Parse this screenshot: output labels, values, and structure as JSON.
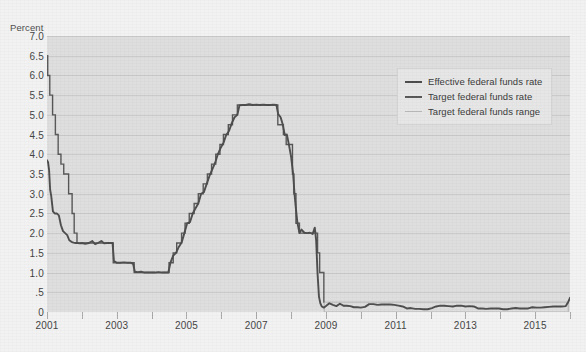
{
  "chart_data": {
    "type": "line",
    "title": "",
    "subtitle": "",
    "xlabel": "",
    "ylabel": "Percent",
    "ylim": [
      0,
      7.0
    ],
    "xlim": [
      2001,
      2016
    ],
    "grid": true,
    "legend_position": "upper-right",
    "y_ticks": [
      "0",
      ".5",
      "1.0",
      "1.5",
      "2.0",
      "2.5",
      "3.0",
      "3.5",
      "4.0",
      "4.5",
      "5.0",
      "5.5",
      "6.0",
      "6.5",
      "7.0"
    ],
    "y_tick_values": [
      0,
      0.5,
      1.0,
      1.5,
      2.0,
      2.5,
      3.0,
      3.5,
      4.0,
      4.5,
      5.0,
      5.5,
      6.0,
      6.5,
      7.0
    ],
    "x_ticks": [
      "2001",
      "2003",
      "2005",
      "2007",
      "2009",
      "2011",
      "2013",
      "2015"
    ],
    "x_tick_values": [
      2001,
      2003,
      2005,
      2007,
      2009,
      2011,
      2013,
      2015
    ],
    "x_minor_tick_values": [
      2001,
      2002,
      2003,
      2004,
      2005,
      2006,
      2007,
      2008,
      2009,
      2010,
      2011,
      2012,
      2013,
      2014,
      2015,
      2016
    ],
    "colors": {
      "effective": "#4a4a4a",
      "target": "#555555",
      "range": "#b9b9b9",
      "plot_background": "#dddddd",
      "page_background": "#f2f2f2",
      "gridline": "#c9c9c9",
      "text": "#3f3f3f"
    },
    "series": [
      {
        "name": "Effective federal funds rate",
        "color": "#4a4a4a",
        "points": [
          [
            2001.0,
            3.85
          ],
          [
            2001.03,
            3.8
          ],
          [
            2001.06,
            3.6
          ],
          [
            2001.09,
            3.1
          ],
          [
            2001.12,
            2.95
          ],
          [
            2001.17,
            2.55
          ],
          [
            2001.22,
            2.5
          ],
          [
            2001.28,
            2.5
          ],
          [
            2001.34,
            2.45
          ],
          [
            2001.4,
            2.2
          ],
          [
            2001.46,
            2.05
          ],
          [
            2001.52,
            2.0
          ],
          [
            2001.58,
            1.95
          ],
          [
            2001.64,
            1.82
          ],
          [
            2001.7,
            1.78
          ],
          [
            2001.76,
            1.76
          ],
          [
            2001.82,
            1.75
          ],
          [
            2001.88,
            1.75
          ],
          [
            2001.94,
            1.74
          ],
          [
            2002.0,
            1.75
          ],
          [
            2002.1,
            1.73
          ],
          [
            2002.2,
            1.75
          ],
          [
            2002.3,
            1.8
          ],
          [
            2002.38,
            1.72
          ],
          [
            2002.46,
            1.75
          ],
          [
            2002.56,
            1.8
          ],
          [
            2002.64,
            1.74
          ],
          [
            2002.72,
            1.75
          ],
          [
            2002.8,
            1.75
          ],
          [
            2002.88,
            1.75
          ],
          [
            2002.92,
            1.3
          ],
          [
            2003.0,
            1.25
          ],
          [
            2003.1,
            1.25
          ],
          [
            2003.2,
            1.26
          ],
          [
            2003.3,
            1.25
          ],
          [
            2003.4,
            1.25
          ],
          [
            2003.47,
            1.22
          ],
          [
            2003.52,
            1.02
          ],
          [
            2003.6,
            1.01
          ],
          [
            2003.7,
            1.02
          ],
          [
            2003.8,
            1.0
          ],
          [
            2003.9,
            1.0
          ],
          [
            2004.0,
            1.0
          ],
          [
            2004.1,
            1.0
          ],
          [
            2004.2,
            1.01
          ],
          [
            2004.3,
            1.0
          ],
          [
            2004.4,
            1.0
          ],
          [
            2004.48,
            1.0
          ],
          [
            2004.54,
            1.25
          ],
          [
            2004.62,
            1.43
          ],
          [
            2004.7,
            1.5
          ],
          [
            2004.78,
            1.65
          ],
          [
            2004.86,
            1.76
          ],
          [
            2004.94,
            2.0
          ],
          [
            2005.02,
            2.25
          ],
          [
            2005.1,
            2.28
          ],
          [
            2005.18,
            2.5
          ],
          [
            2005.26,
            2.63
          ],
          [
            2005.34,
            2.75
          ],
          [
            2005.42,
            3.0
          ],
          [
            2005.5,
            3.04
          ],
          [
            2005.58,
            3.25
          ],
          [
            2005.66,
            3.45
          ],
          [
            2005.74,
            3.62
          ],
          [
            2005.82,
            3.78
          ],
          [
            2005.9,
            4.0
          ],
          [
            2005.98,
            4.16
          ],
          [
            2006.06,
            4.29
          ],
          [
            2006.14,
            4.49
          ],
          [
            2006.22,
            4.59
          ],
          [
            2006.3,
            4.79
          ],
          [
            2006.38,
            4.94
          ],
          [
            2006.46,
            5.0
          ],
          [
            2006.52,
            5.24
          ],
          [
            2006.6,
            5.25
          ],
          [
            2006.7,
            5.25
          ],
          [
            2006.8,
            5.27
          ],
          [
            2006.9,
            5.25
          ],
          [
            2007.0,
            5.26
          ],
          [
            2007.1,
            5.25
          ],
          [
            2007.2,
            5.26
          ],
          [
            2007.3,
            5.25
          ],
          [
            2007.4,
            5.25
          ],
          [
            2007.5,
            5.26
          ],
          [
            2007.58,
            5.25
          ],
          [
            2007.63,
            5.02
          ],
          [
            2007.7,
            4.94
          ],
          [
            2007.76,
            4.76
          ],
          [
            2007.82,
            4.49
          ],
          [
            2007.88,
            4.5
          ],
          [
            2007.94,
            4.24
          ],
          [
            2008.0,
            3.94
          ],
          [
            2008.06,
            3.5
          ],
          [
            2008.1,
            2.98
          ],
          [
            2008.14,
            2.61
          ],
          [
            2008.18,
            2.28
          ],
          [
            2008.24,
            2.0
          ],
          [
            2008.3,
            2.09
          ],
          [
            2008.38,
            2.01
          ],
          [
            2008.46,
            2.0
          ],
          [
            2008.54,
            2.01
          ],
          [
            2008.62,
            1.98
          ],
          [
            2008.68,
            2.14
          ],
          [
            2008.72,
            1.81
          ],
          [
            2008.76,
            0.97
          ],
          [
            2008.8,
            0.39
          ],
          [
            2008.84,
            0.22
          ],
          [
            2008.88,
            0.14
          ],
          [
            2008.94,
            0.11
          ],
          [
            2009.0,
            0.15
          ],
          [
            2009.1,
            0.22
          ],
          [
            2009.2,
            0.18
          ],
          [
            2009.3,
            0.15
          ],
          [
            2009.4,
            0.21
          ],
          [
            2009.5,
            0.16
          ],
          [
            2009.6,
            0.16
          ],
          [
            2009.7,
            0.15
          ],
          [
            2009.8,
            0.12
          ],
          [
            2009.9,
            0.12
          ],
          [
            2010.0,
            0.11
          ],
          [
            2010.12,
            0.13
          ],
          [
            2010.24,
            0.2
          ],
          [
            2010.36,
            0.2
          ],
          [
            2010.48,
            0.18
          ],
          [
            2010.6,
            0.19
          ],
          [
            2010.72,
            0.19
          ],
          [
            2010.84,
            0.19
          ],
          [
            2010.96,
            0.18
          ],
          [
            2011.08,
            0.16
          ],
          [
            2011.2,
            0.14
          ],
          [
            2011.32,
            0.09
          ],
          [
            2011.44,
            0.1
          ],
          [
            2011.56,
            0.08
          ],
          [
            2011.68,
            0.08
          ],
          [
            2011.8,
            0.07
          ],
          [
            2011.92,
            0.07
          ],
          [
            2012.04,
            0.1
          ],
          [
            2012.16,
            0.14
          ],
          [
            2012.28,
            0.16
          ],
          [
            2012.4,
            0.16
          ],
          [
            2012.52,
            0.15
          ],
          [
            2012.64,
            0.14
          ],
          [
            2012.76,
            0.16
          ],
          [
            2012.88,
            0.16
          ],
          [
            2013.0,
            0.14
          ],
          [
            2013.12,
            0.15
          ],
          [
            2013.24,
            0.14
          ],
          [
            2013.36,
            0.09
          ],
          [
            2013.48,
            0.09
          ],
          [
            2013.6,
            0.08
          ],
          [
            2013.72,
            0.09
          ],
          [
            2013.84,
            0.09
          ],
          [
            2013.96,
            0.09
          ],
          [
            2014.08,
            0.07
          ],
          [
            2014.2,
            0.07
          ],
          [
            2014.32,
            0.09
          ],
          [
            2014.44,
            0.1
          ],
          [
            2014.56,
            0.09
          ],
          [
            2014.68,
            0.09
          ],
          [
            2014.8,
            0.09
          ],
          [
            2014.92,
            0.12
          ],
          [
            2015.04,
            0.11
          ],
          [
            2015.16,
            0.11
          ],
          [
            2015.28,
            0.12
          ],
          [
            2015.4,
            0.13
          ],
          [
            2015.52,
            0.14
          ],
          [
            2015.64,
            0.14
          ],
          [
            2015.76,
            0.14
          ],
          [
            2015.88,
            0.15
          ],
          [
            2015.94,
            0.24
          ],
          [
            2016.0,
            0.36
          ]
        ]
      },
      {
        "name": "Target federal funds rate",
        "color": "#555555",
        "points": [
          [
            2001.0,
            6.5
          ],
          [
            2001.02,
            6.0
          ],
          [
            2001.08,
            5.5
          ],
          [
            2001.16,
            5.0
          ],
          [
            2001.24,
            4.5
          ],
          [
            2001.32,
            4.0
          ],
          [
            2001.4,
            3.75
          ],
          [
            2001.48,
            3.5
          ],
          [
            2001.62,
            3.0
          ],
          [
            2001.72,
            2.5
          ],
          [
            2001.78,
            2.0
          ],
          [
            2001.86,
            1.75
          ],
          [
            2002.9,
            1.25
          ],
          [
            2003.5,
            1.0
          ],
          [
            2004.5,
            1.25
          ],
          [
            2004.62,
            1.5
          ],
          [
            2004.72,
            1.75
          ],
          [
            2004.86,
            2.0
          ],
          [
            2004.96,
            2.25
          ],
          [
            2005.08,
            2.5
          ],
          [
            2005.22,
            2.75
          ],
          [
            2005.34,
            3.0
          ],
          [
            2005.48,
            3.25
          ],
          [
            2005.6,
            3.5
          ],
          [
            2005.72,
            3.75
          ],
          [
            2005.84,
            4.0
          ],
          [
            2005.96,
            4.25
          ],
          [
            2006.06,
            4.5
          ],
          [
            2006.2,
            4.75
          ],
          [
            2006.32,
            5.0
          ],
          [
            2006.46,
            5.25
          ],
          [
            2007.62,
            4.75
          ],
          [
            2007.78,
            4.5
          ],
          [
            2007.86,
            4.25
          ],
          [
            2008.04,
            3.5
          ],
          [
            2008.08,
            3.0
          ],
          [
            2008.14,
            2.25
          ],
          [
            2008.24,
            2.0
          ],
          [
            2008.76,
            1.5
          ],
          [
            2008.82,
            1.0
          ],
          [
            2008.94,
            0.25
          ]
        ]
      },
      {
        "name": "Target federal funds range",
        "color": "#b9b9b9",
        "upper": 0.25,
        "lower": 0.0,
        "start": 2008.95,
        "end": 2015.95,
        "note": "0 to 0.25 percent band from December 2008"
      }
    ],
    "legend": [
      {
        "label": "Effective federal funds rate",
        "color": "#4a4a4a",
        "width": 2.2
      },
      {
        "label": "Target federal funds rate",
        "color": "#555555",
        "width": 2.2
      },
      {
        "label": "Target federal funds range",
        "color": "#b9b9b9",
        "width": 1.8
      }
    ]
  }
}
